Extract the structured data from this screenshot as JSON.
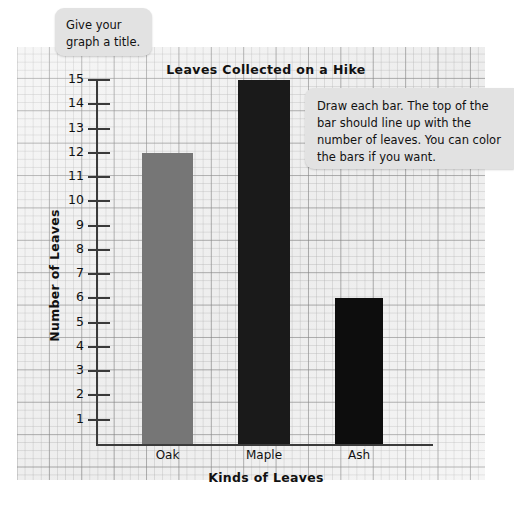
{
  "worksheet": {
    "callouts": [
      {
        "name": "title-hint",
        "text": "Give your graph a title."
      },
      {
        "name": "bars-hint",
        "text": "Draw each bar. The top of the bar should line up with the number of leaves. You can color the bars if you want."
      }
    ]
  },
  "chart_data": {
    "type": "bar",
    "title": "Leaves Collected on a Hike",
    "xlabel": "Kinds of Leaves",
    "ylabel": "Number of Leaves",
    "categories": [
      "Oak",
      "Maple",
      "Ash"
    ],
    "values": [
      12,
      15,
      6
    ],
    "bar_colors": [
      "#767676",
      "#1a1a1a",
      "#0d0d0d"
    ],
    "ylim": [
      0,
      15
    ],
    "ytick_labels": [
      "15",
      "14",
      "13",
      "12",
      "11",
      "10",
      "9",
      "8",
      "7",
      "6",
      "5",
      "4",
      "3",
      "2",
      "1"
    ],
    "grid": true,
    "legend": "none"
  }
}
